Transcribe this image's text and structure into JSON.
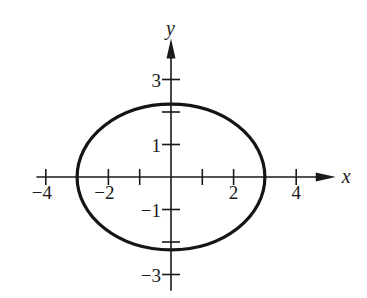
{
  "chart_data": {
    "type": "line",
    "title": "",
    "xlabel": "x",
    "ylabel": "y",
    "xlim": [
      -4.3,
      5.2
    ],
    "ylim": [
      -3.5,
      4.2
    ],
    "grid": false,
    "legend": null,
    "x_ticks": [
      -4,
      -3,
      -2,
      -1,
      1,
      2,
      3,
      4
    ],
    "x_tick_labels": [
      {
        "value": -4,
        "label": "−4"
      },
      {
        "value": -2,
        "label": "−2"
      },
      {
        "value": 2,
        "label": "2"
      },
      {
        "value": 4,
        "label": "4"
      }
    ],
    "y_ticks": [
      -3,
      -2,
      -1,
      1,
      2,
      3
    ],
    "y_tick_labels": [
      {
        "value": 3,
        "label": "3"
      },
      {
        "value": 1,
        "label": "1"
      },
      {
        "value": -1,
        "label": "−1"
      },
      {
        "value": -3,
        "label": "−3"
      }
    ],
    "series": [
      {
        "name": "ellipse",
        "shape": "ellipse",
        "center": [
          0,
          0
        ],
        "semi_axis_x": 3,
        "semi_axis_y": 2.24,
        "points": [
          [
            3,
            0
          ],
          [
            2.6,
            1.12
          ],
          [
            1.5,
            1.94
          ],
          [
            0,
            2.24
          ],
          [
            -1.5,
            1.94
          ],
          [
            -2.6,
            1.12
          ],
          [
            -3,
            0
          ],
          [
            -2.6,
            -1.12
          ],
          [
            -1.5,
            -1.94
          ],
          [
            0,
            -2.24
          ],
          [
            1.5,
            -1.94
          ],
          [
            2.6,
            -1.12
          ],
          [
            3,
            0
          ]
        ]
      }
    ]
  },
  "layout": {
    "origin_px": [
      171,
      177
    ],
    "unit_x_px": 31.3,
    "unit_y_px": 32.5
  }
}
